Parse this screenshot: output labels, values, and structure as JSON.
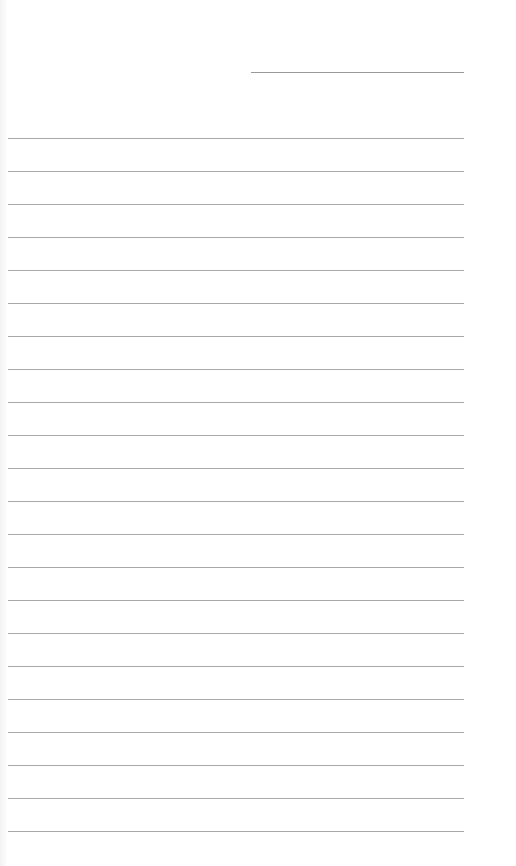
{
  "page": {
    "type": "lined-paper",
    "background": "#ffffff",
    "line_color": "#a8a8a8",
    "header_line": {
      "label": ""
    },
    "rule_count": 22,
    "first_rule_y": 138,
    "rule_spacing": 33
  }
}
